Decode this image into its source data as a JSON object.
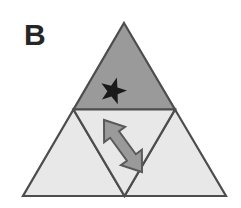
{
  "figure": {
    "panel_label": "B",
    "background_color": "#ffffff"
  },
  "colors": {
    "stroke": "#4d4d4d",
    "dark_fill": "#9a9a9a",
    "light_fill": "#e8e8e8",
    "star_fill": "#1a1a1a",
    "arrow_fill": "#9a9a9a",
    "arrow_stroke": "#595959",
    "label_color": "#262626"
  },
  "geometry": {
    "apex": [
      124,
      23
    ],
    "bottom_left": [
      23,
      196
    ],
    "bottom_right": [
      226,
      196
    ],
    "mid_left": [
      73.5,
      109.5
    ],
    "mid_right": [
      175,
      109.5
    ],
    "mid_bottom": [
      124.5,
      196
    ]
  },
  "shapes": [
    {
      "name": "top-subtriangle",
      "label": "top",
      "points": "124,23 175,109.5 73.5,109.5",
      "fill_key": "dark_fill"
    },
    {
      "name": "bottom-left-subtriangle",
      "label": "bottom-left",
      "points": "73.5,109.5 124.5,196 23,196",
      "fill_key": "light_fill"
    },
    {
      "name": "bottom-right-subtriangle",
      "label": "bottom-right",
      "points": "175,109.5 226,196 124.5,196",
      "fill_key": "light_fill"
    },
    {
      "name": "center-inverted-subtriangle",
      "label": "center",
      "points": "73.5,109.5 175,109.5 124.5,196",
      "fill_key": "light_fill"
    }
  ],
  "markers": {
    "star": {
      "name": "star-marker",
      "center": [
        113,
        91
      ],
      "outer_radius": 14,
      "inner_radius": 5.6,
      "rotation_deg": 16,
      "points": 5,
      "fill": "#1a1a1a"
    },
    "arrow": {
      "name": "double-headed-arrow",
      "direction": "up-left / down-right",
      "start": [
        104,
        120
      ],
      "end": [
        142,
        172
      ],
      "fill": "#9a9a9a",
      "stroke": "#595959"
    }
  }
}
